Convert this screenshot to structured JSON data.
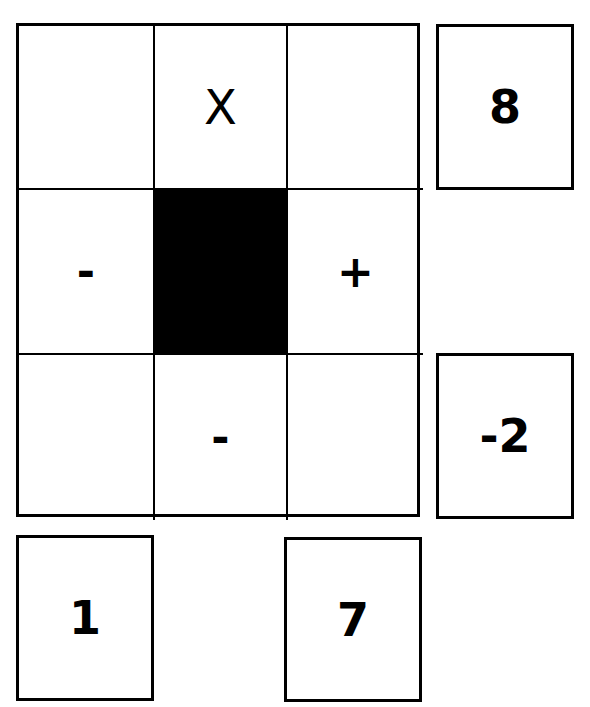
{
  "grid": {
    "rows": [
      [
        {
          "label": "",
          "filled": false
        },
        {
          "label": "X",
          "filled": false
        },
        {
          "label": "",
          "filled": false
        }
      ],
      [
        {
          "label": "-",
          "filled": false
        },
        {
          "label": "",
          "filled": true
        },
        {
          "label": "+",
          "filled": false
        }
      ],
      [
        {
          "label": "",
          "filled": false
        },
        {
          "label": "-",
          "filled": false
        },
        {
          "label": "",
          "filled": false
        }
      ]
    ]
  },
  "side_boxes": {
    "right_top": "8",
    "right_bottom": "-2",
    "bottom_left": "1",
    "bottom_right": "7"
  }
}
